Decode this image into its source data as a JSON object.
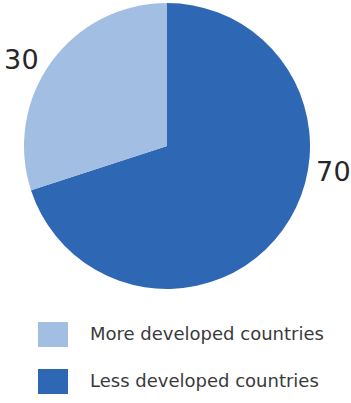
{
  "chart_data": {
    "type": "pie",
    "title": "",
    "subtitle": "",
    "xlabel": "",
    "ylabel": "",
    "grid": false,
    "legend_position": "bottom-left",
    "start_angle_deg": 0,
    "direction": "clockwise",
    "categories": [
      "More developed countries",
      "Less developed countries"
    ],
    "values": [
      30,
      70
    ],
    "unit": "percent",
    "colors": [
      "#a3bee3",
      "#2e68b4"
    ],
    "slices": [
      {
        "label": "More developed countries",
        "value": 30,
        "value_text": "30",
        "color": "#a3bee3",
        "start_deg": 252,
        "sweep_deg": 108,
        "label_position": "left"
      },
      {
        "label": "Less developed countries",
        "value": 70,
        "value_text": "70",
        "color": "#2e68b4",
        "start_deg": 0,
        "sweep_deg": 252,
        "label_position": "right"
      }
    ],
    "annotations": [
      {
        "text": "30",
        "anchor": "more-developed-slice"
      },
      {
        "text": "70",
        "anchor": "less-developed-slice"
      }
    ]
  },
  "labels": {
    "more_value": "30",
    "less_value": "70"
  },
  "legend": {
    "items": [
      {
        "label": "More developed countries",
        "color": "#a3bee3"
      },
      {
        "label": "Less developed countries",
        "color": "#2e68b4"
      }
    ]
  },
  "colors": {
    "more_developed": "#a3bee3",
    "less_developed": "#2e68b4",
    "label_text": "#26262a",
    "legend_text": "#3a3a3c",
    "background": "#ffffff"
  }
}
